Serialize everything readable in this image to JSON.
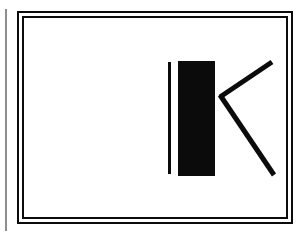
{
  "canvas": {
    "width": 302,
    "height": 237,
    "background_color": "#ffffff",
    "ink_color": "#0b0b0b",
    "rule_color": "#8e8e8e"
  },
  "margin_rule": {
    "name": "left margin rule",
    "color": "#8e8e8e",
    "x": 5,
    "y": 9,
    "width": 2,
    "height": 222
  },
  "frame": {
    "name": "double-line rectangular border",
    "style": "double",
    "color": "#0b0b0b",
    "outer": {
      "x": 17,
      "y": 11,
      "width": 276,
      "height": 213,
      "stroke": 2
    },
    "gap": 3,
    "inner_stroke": 2,
    "fill": "#ffffff"
  },
  "artwork": {
    "name": "letterform K",
    "description": "constructivist stencil letter K",
    "character": "K",
    "color": "#0b0b0b",
    "strokes": [
      {
        "name": "thin-vertical-stroke",
        "type": "rect",
        "x": 168,
        "y": 62,
        "width": 3,
        "height": 112
      },
      {
        "name": "thick-stem-block",
        "type": "rect",
        "x": 178,
        "y": 61,
        "width": 37,
        "height": 115
      },
      {
        "name": "upper-diagonal-arm",
        "type": "line",
        "x1": 220,
        "y1": 97,
        "x2": 272,
        "y2": 62,
        "stroke": 5
      },
      {
        "name": "lower-diagonal-leg",
        "type": "line",
        "x1": 220,
        "y1": 95,
        "x2": 274,
        "y2": 175,
        "stroke": 5
      }
    ]
  }
}
